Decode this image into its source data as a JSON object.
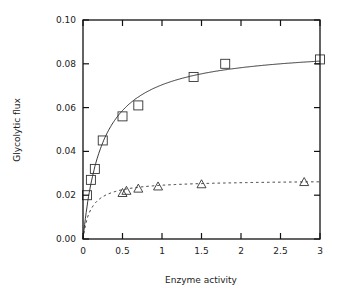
{
  "chart_data": {
    "type": "scatter",
    "title": "",
    "xlabel": "Enzyme activity",
    "ylabel": "Glycolytic flux",
    "xlim": [
      0,
      3
    ],
    "ylim": [
      0,
      0.1
    ],
    "x_ticks": [
      "0",
      "0.5",
      "1",
      "1.5",
      "2",
      "2.5",
      "3"
    ],
    "y_ticks": [
      "0.00",
      "0.02",
      "0.04",
      "0.06",
      "0.08",
      "0.10"
    ],
    "grid": false,
    "legend": null,
    "series": [
      {
        "name": "squares",
        "marker": "square",
        "x": [
          0.05,
          0.1,
          0.15,
          0.25,
          0.5,
          0.7,
          1.4,
          1.8,
          3.0
        ],
        "y": [
          0.02,
          0.027,
          0.032,
          0.045,
          0.056,
          0.061,
          0.074,
          0.08,
          0.082
        ],
        "fit": {
          "style": "solid",
          "vmax": 0.088,
          "km": 0.25
        }
      },
      {
        "name": "triangles",
        "marker": "triangle",
        "x": [
          0.5,
          0.55,
          0.7,
          0.95,
          1.5,
          2.8
        ],
        "y": [
          0.021,
          0.022,
          0.023,
          0.024,
          0.025,
          0.026
        ],
        "fit": {
          "style": "dashed",
          "vmax": 0.027,
          "km": 0.1
        }
      }
    ]
  }
}
